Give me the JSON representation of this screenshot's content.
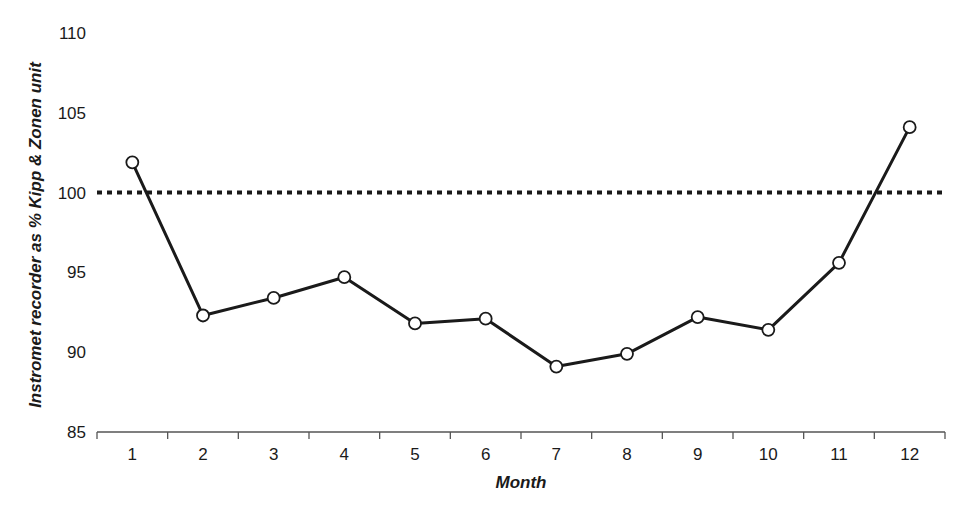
{
  "chart_data": {
    "type": "line",
    "title": "",
    "xlabel": "Month",
    "ylabel": "Instromet recorder as % Kipp & Zonen unit",
    "categories": [
      "1",
      "2",
      "3",
      "4",
      "5",
      "6",
      "7",
      "8",
      "9",
      "10",
      "11",
      "12"
    ],
    "series": [
      {
        "name": "Instromet recorder as % Kipp & Zonen unit",
        "values": [
          101.9,
          92.3,
          93.4,
          94.7,
          91.8,
          92.1,
          89.1,
          89.9,
          92.2,
          91.4,
          95.6,
          104.1
        ],
        "marker": "open-circle",
        "color": "#1a1a1a"
      }
    ],
    "reference_line": {
      "y": 100,
      "style": "dotted",
      "color": "#1a1a1a"
    },
    "yticks": [
      85,
      90,
      95,
      100,
      105,
      110
    ],
    "ylim": [
      85,
      110
    ],
    "grid": false,
    "legend": "none"
  }
}
